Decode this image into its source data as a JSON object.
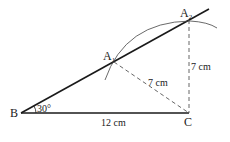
{
  "diagram": {
    "points": {
      "B": {
        "label": "B",
        "x": 21,
        "y": 113
      },
      "C": {
        "label": "C",
        "x": 189,
        "y": 113
      },
      "A1": {
        "label": "A",
        "sub": "1",
        "x": 114,
        "y": 62
      },
      "A2": {
        "label": "A",
        "sub": "2",
        "x": 189,
        "y": 20
      }
    },
    "labels": {
      "angle": "30°",
      "base": "12 cm",
      "a1c": "7 cm",
      "a2c": "7 cm"
    },
    "colors": {
      "line": "#1a1a1a",
      "dash": "#555555"
    }
  }
}
